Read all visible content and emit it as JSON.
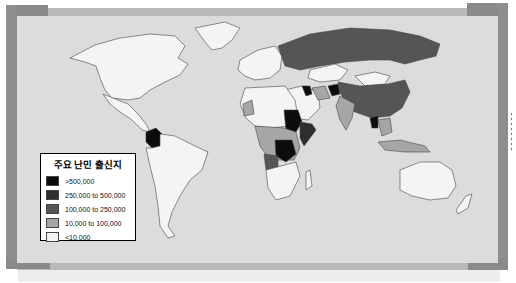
{
  "map": {
    "type": "choropleth world map",
    "subject": "Major refugee countries of origin",
    "background_color": "#dcdcdc",
    "frame_color_dark": "#8a8a8a",
    "frame_color_light": "#b9b9b9"
  },
  "legend": {
    "title": "주요 난민 출신지",
    "items": [
      {
        "label": ">500,000",
        "color": "#0c0c0c"
      },
      {
        "label": "250,000 to 500,000",
        "color": "#2e2e2e"
      },
      {
        "label": "100,000 to 250,000",
        "color": "#555555"
      },
      {
        "label": "10,000 to 100,000",
        "color": "#a6a6a6"
      },
      {
        "label": "<10,000",
        "color": "#f4f4f4"
      }
    ]
  },
  "regions": {
    "colombia": ">500,000",
    "sudan": ">500,000",
    "dr_congo": ">500,000",
    "afghanistan": ">500,000",
    "iraq": ">500,000",
    "myanmar": ">500,000",
    "russia": "100,000 to 250,000",
    "china": "100,000 to 250,000",
    "angola": "100,000 to 250,000",
    "somalia": "250,000 to 500,000",
    "india": "10,000 to 100,000",
    "iran": "10,000 to 100,000",
    "north_america": "<10,000",
    "australia": "<10,000",
    "south_america_other": "<10,000",
    "europe": "<10,000"
  }
}
